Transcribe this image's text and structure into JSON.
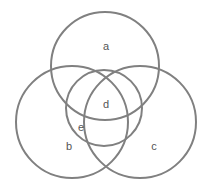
{
  "figure": {
    "name": "venn-diagram",
    "background_color": "#ffffff",
    "width": 209,
    "height": 190
  },
  "style": {
    "stroke_color": "#808080",
    "stroke_width": 2,
    "label_color": "#555555",
    "label_font_size": 11
  },
  "circles": [
    {
      "id": "a",
      "cx": 105,
      "cy": 66,
      "r": 54,
      "stroke": "#808080"
    },
    {
      "id": "b",
      "cx": 72,
      "cy": 122,
      "r": 56,
      "stroke": "#808080"
    },
    {
      "id": "c",
      "cx": 140,
      "cy": 122,
      "r": 56,
      "stroke": "#808080"
    },
    {
      "id": "d",
      "cx": 104,
      "cy": 108,
      "r": 38,
      "stroke": "#808080"
    }
  ],
  "labels": {
    "a": {
      "text": "a",
      "x": 106,
      "y": 47
    },
    "d": {
      "text": "d",
      "x": 106,
      "y": 105
    },
    "e": {
      "text": "e",
      "x": 81,
      "y": 128
    },
    "b": {
      "text": "b",
      "x": 69,
      "y": 147
    },
    "c": {
      "text": "c",
      "x": 154,
      "y": 147
    }
  }
}
